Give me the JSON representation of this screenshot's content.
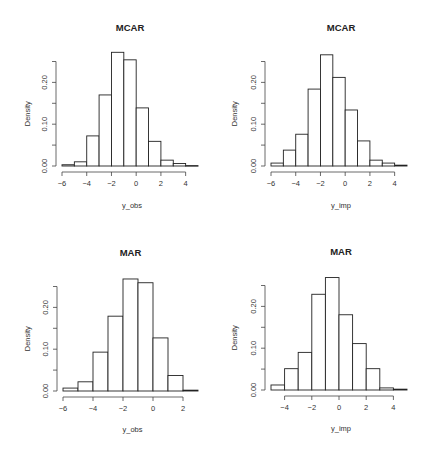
{
  "chart_data": [
    {
      "type": "bar",
      "title": "MCAR",
      "xlabel": "y_obs",
      "ylabel": "Density",
      "bin_edges": [
        -6,
        -5,
        -4,
        -3,
        -2,
        -1,
        0,
        1,
        2,
        3,
        4,
        5
      ],
      "values": [
        0.003,
        0.01,
        0.072,
        0.17,
        0.272,
        0.254,
        0.139,
        0.059,
        0.014,
        0.006,
        0.001
      ],
      "xticks": [
        -6,
        -4,
        -2,
        0,
        2,
        4
      ],
      "xtick_labels": [
        "-6",
        "-4",
        "-2",
        "0",
        "2",
        "4"
      ],
      "xaxis_range": [
        -6,
        4
      ],
      "yticks": [
        0.0,
        0.05,
        0.1,
        0.15,
        0.2,
        0.25
      ],
      "ytick_labels": [
        "0.00",
        "",
        "0.10",
        "",
        "0.20",
        ""
      ],
      "ylim": [
        0,
        0.272
      ],
      "grid": false
    },
    {
      "type": "bar",
      "title": "MCAR",
      "xlabel": "y_imp",
      "ylabel": "Density",
      "bin_edges": [
        -6,
        -5,
        -4,
        -3,
        -2,
        -1,
        0,
        1,
        2,
        3,
        4,
        5
      ],
      "values": [
        0.007,
        0.038,
        0.076,
        0.184,
        0.266,
        0.212,
        0.134,
        0.06,
        0.014,
        0.007,
        0.002
      ],
      "xticks": [
        -6,
        -4,
        -2,
        0,
        2,
        4
      ],
      "xtick_labels": [
        "-6",
        "-4",
        "-2",
        "0",
        "2",
        "4"
      ],
      "xaxis_range": [
        -6,
        4
      ],
      "yticks": [
        0.0,
        0.05,
        0.1,
        0.15,
        0.2,
        0.25
      ],
      "ytick_labels": [
        "0.00",
        "",
        "0.10",
        "",
        "0.20",
        ""
      ],
      "ylim": [
        0,
        0.266
      ],
      "grid": false
    },
    {
      "type": "bar",
      "title": "MAR",
      "xlabel": "y_obs",
      "ylabel": "Density",
      "bin_edges": [
        -6,
        -5,
        -4,
        -3,
        -2,
        -1,
        0,
        1,
        2,
        3
      ],
      "values": [
        0.007,
        0.022,
        0.093,
        0.179,
        0.268,
        0.259,
        0.127,
        0.037,
        0.002
      ],
      "xticks": [
        -6,
        -4,
        -2,
        0,
        2
      ],
      "xtick_labels": [
        "-6",
        "-4",
        "-2",
        "0",
        "2"
      ],
      "xaxis_range": [
        -6,
        2
      ],
      "yticks": [
        0.0,
        0.05,
        0.1,
        0.15,
        0.2,
        0.25
      ],
      "ytick_labels": [
        "0.00",
        "",
        "0.10",
        "",
        "0.20",
        ""
      ],
      "ylim": [
        0,
        0.268
      ],
      "grid": false
    },
    {
      "type": "bar",
      "title": "MAR",
      "xlabel": "y_imp",
      "ylabel": "Density",
      "bin_edges": [
        -5,
        -4,
        -3,
        -2,
        -1,
        0,
        1,
        2,
        3,
        4,
        5
      ],
      "values": [
        0.012,
        0.051,
        0.09,
        0.229,
        0.269,
        0.18,
        0.111,
        0.051,
        0.005,
        0.002
      ],
      "xticks": [
        -4,
        -2,
        0,
        2,
        4
      ],
      "xtick_labels": [
        "-4",
        "-2",
        "0",
        "2",
        "4"
      ],
      "xaxis_range": [
        -4,
        4
      ],
      "yticks": [
        0.0,
        0.05,
        0.1,
        0.15,
        0.2,
        0.25
      ],
      "ytick_labels": [
        "0.00",
        "",
        "0.10",
        "",
        "0.20",
        ""
      ],
      "ylim": [
        0,
        0.269
      ],
      "grid": false
    }
  ],
  "style": {
    "bar_fill": "#ffffff",
    "bar_stroke": "#222222",
    "axis_color": "#444444"
  }
}
